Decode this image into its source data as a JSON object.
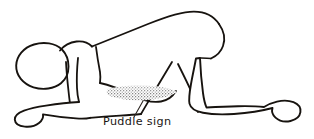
{
  "figure": {
    "name": "puddle-sign-illustration",
    "background_color": "#ffffff",
    "ink_color": "#17130f",
    "width": 314,
    "height": 139
  },
  "caption": {
    "label": "Puddle  sign",
    "x": 103,
    "y": 125,
    "color": "#1a1613"
  },
  "puddle": {
    "name": "puddle-shading",
    "fill_color": "#9b9b9b",
    "stipple_color": "#6f6f6f",
    "center_x": 140,
    "center_y": 94
  },
  "leader": {
    "from_x": 134,
    "from_y": 118,
    "to_x": 143,
    "to_y": 101
  },
  "parts": [
    {
      "name": "head",
      "label": "Head"
    },
    {
      "name": "neck",
      "label": "Neck"
    },
    {
      "name": "back",
      "label": "Back"
    },
    {
      "name": "buttock",
      "label": "Buttock"
    },
    {
      "name": "abdomen",
      "label": "Dependent abdomen"
    },
    {
      "name": "forearm",
      "label": "Forearm resting on surface"
    },
    {
      "name": "upper-arm",
      "label": "Upper arm"
    },
    {
      "name": "near-thigh",
      "label": "Near thigh"
    },
    {
      "name": "near-shin",
      "label": "Near shin"
    },
    {
      "name": "far-leg",
      "label": "Far leg"
    },
    {
      "name": "foot",
      "label": "Foot"
    }
  ]
}
